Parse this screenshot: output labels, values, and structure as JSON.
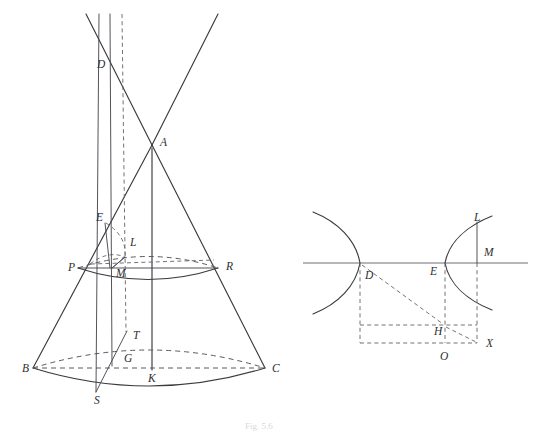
{
  "page": {
    "background_color": "#ffffff",
    "ink_color": "#3b3b3f",
    "width": 534,
    "height": 435
  },
  "caption": {
    "text": "Fig. 5.6",
    "visible": "partially-cropped"
  },
  "figures": [
    {
      "id": "left-figure",
      "name": "double-cone-with-section",
      "description": "Double cone with apex A, base circle BC, cutting plane producing section through P, R, and a hyperbolic curve through S",
      "labels": [
        {
          "text": "D",
          "x": 97,
          "y": 68
        },
        {
          "text": "A",
          "x": 160,
          "y": 146
        },
        {
          "text": "E",
          "x": 96,
          "y": 221
        },
        {
          "text": "L",
          "x": 130,
          "y": 246
        },
        {
          "text": "P",
          "x": 68,
          "y": 271
        },
        {
          "text": "M",
          "x": 116,
          "y": 277
        },
        {
          "text": "R",
          "x": 226,
          "y": 270
        },
        {
          "text": "T",
          "x": 133,
          "y": 339
        },
        {
          "text": "G",
          "x": 124,
          "y": 362
        },
        {
          "text": "B",
          "x": 22,
          "y": 372
        },
        {
          "text": "K",
          "x": 148,
          "y": 382
        },
        {
          "text": "C",
          "x": 272,
          "y": 372
        },
        {
          "text": "S",
          "x": 94,
          "y": 404
        }
      ]
    },
    {
      "id": "right-figure",
      "name": "hyperbola-two-branches",
      "description": "Two hyperbola branches astride a horizontal axis, with dashed rectangle construction through D, E, H, O, X and ordinate LM",
      "labels": [
        {
          "text": "L",
          "x": 474,
          "y": 221
        },
        {
          "text": "M",
          "x": 484,
          "y": 256
        },
        {
          "text": "D",
          "x": 365,
          "y": 279
        },
        {
          "text": "E",
          "x": 430,
          "y": 275
        },
        {
          "text": "H",
          "x": 434,
          "y": 335
        },
        {
          "text": "O",
          "x": 440,
          "y": 360
        },
        {
          "text": "X",
          "x": 486,
          "y": 347
        }
      ]
    }
  ],
  "geometry": {
    "left": {
      "apex_A": [
        152,
        145
      ],
      "base_left_B": [
        33,
        368
      ],
      "base_right_C": [
        265,
        368
      ],
      "axis_foot_K": [
        152,
        368
      ],
      "section_left_P": [
        78,
        268
      ],
      "section_right_R": [
        218,
        268
      ],
      "upper_point_D": [
        107,
        61
      ],
      "point_E": [
        105,
        222
      ],
      "point_L": [
        124,
        257
      ],
      "point_M": [
        112,
        268
      ],
      "point_T": [
        126,
        332
      ],
      "point_G": [
        116,
        353
      ],
      "point_S": [
        96,
        392
      ]
    },
    "right": {
      "axis_y": 263,
      "axis_x_start": 303,
      "axis_x_end": 528,
      "vertex_D": [
        360,
        263
      ],
      "vertex_E": [
        445,
        263
      ],
      "point_L": [
        477,
        225
      ],
      "point_M": [
        477,
        263
      ],
      "point_H": [
        443,
        325
      ],
      "point_O": [
        443,
        343
      ],
      "point_X": [
        477,
        343
      ]
    }
  }
}
